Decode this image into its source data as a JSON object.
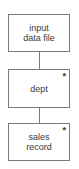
{
  "diagram": {
    "type": "jackson-structure-chart",
    "nodes": [
      {
        "id": "input",
        "label": "input\ndata file",
        "iteration_marker": ""
      },
      {
        "id": "dept",
        "label": "dept",
        "iteration_marker": "*"
      },
      {
        "id": "sales",
        "label": "sales\nrecord",
        "iteration_marker": "*"
      }
    ],
    "edges": [
      {
        "from": "input",
        "to": "dept"
      },
      {
        "from": "dept",
        "to": "sales"
      }
    ],
    "colors": {
      "line": "#7a7a7a",
      "text": "#3a3a3a",
      "background": "#ffffff"
    }
  }
}
